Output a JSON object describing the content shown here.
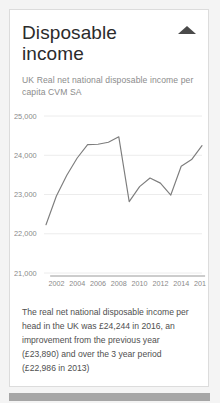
{
  "card": {
    "title": "Disposable income",
    "subtitle": "UK Real net national disposable income per capita CVM SA",
    "collapse_icon": "triangle-up-icon",
    "footer_text": "The real net national disposable income per head in the UK was £24,244 in 2016, an improvement from the previous year (£23,890) and over the 3 year period (£22,986 in 2013)",
    "updated": "Updated: 6 April 2017"
  },
  "colors": {
    "line": "#7d7d7d",
    "grid": "#ececec",
    "axis": "#9a9a9a",
    "title": "#2b2b2b",
    "muted": "#8c8c8c",
    "card_border": "#dcdcdc",
    "page_background": "#f4f4f4",
    "scrollbar_thumb": "#a6a6a6"
  },
  "chart_data": {
    "type": "line",
    "title": "",
    "xlabel": "",
    "ylabel": "",
    "ylim": [
      21000,
      25000
    ],
    "xlim": [
      2001,
      2016
    ],
    "grid": true,
    "legend": false,
    "yticks": [
      21000,
      22000,
      23000,
      24000,
      25000
    ],
    "ytick_labels": [
      "21,000",
      "22,000",
      "23,000",
      "24,000",
      "25,000"
    ],
    "xticks": [
      2002,
      2004,
      2006,
      2008,
      2010,
      2012,
      2014,
      2016
    ],
    "xtick_labels": [
      "2002",
      "2004",
      "2006",
      "2008",
      "2010",
      "2012",
      "2014",
      "2016"
    ],
    "x": [
      2001,
      2002,
      2003,
      2004,
      2005,
      2006,
      2007,
      2008,
      2009,
      2010,
      2011,
      2012,
      2013,
      2014,
      2015,
      2016
    ],
    "values": [
      22230,
      22960,
      23490,
      23930,
      24270,
      24280,
      24330,
      24470,
      22820,
      23200,
      23420,
      23290,
      22986,
      23720,
      23890,
      24244
    ],
    "series": [
      {
        "name": "UK Real net national disposable income per capita CVM SA",
        "values": [
          22230,
          22960,
          23490,
          23930,
          24270,
          24280,
          24330,
          24470,
          22820,
          23200,
          23420,
          23290,
          22986,
          23720,
          23890,
          24244
        ]
      }
    ]
  }
}
